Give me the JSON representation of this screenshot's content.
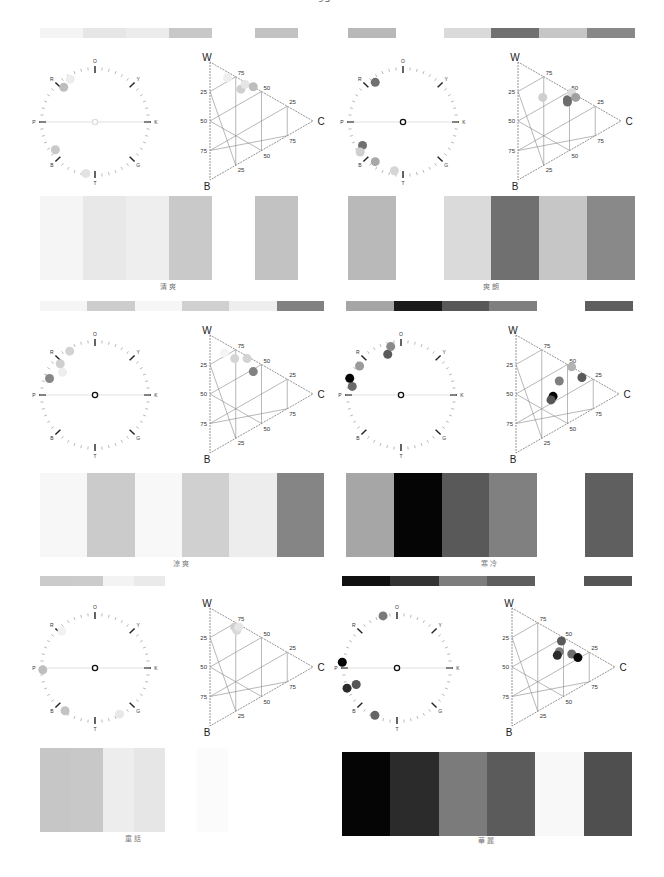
{
  "page_number": "95",
  "chart_data": [
    {
      "type": "palette_panel",
      "title": "清爽",
      "strip_colors": [
        "#f4f4f4",
        "#e6e6e6",
        "#ececec",
        "#c8c8c8",
        "",
        "#c2c2c2"
      ],
      "swatch_colors": [
        "#f5f5f5",
        "#e8e8e8",
        "#eeeeee",
        "#c9c9c9",
        "",
        "#c2c2c2"
      ],
      "hue_wheel": {
        "labels": [
          "O",
          "Y",
          "K",
          "G",
          "T",
          "B",
          "P",
          "R"
        ],
        "points": [
          {
            "angle": 100,
            "r": 0.95,
            "color": "#e3e3e3"
          },
          {
            "angle": 145,
            "r": 0.88,
            "color": "#c9c9c9"
          },
          {
            "angle": 228,
            "r": 0.85,
            "color": "#bdbdbd"
          },
          {
            "angle": 240,
            "r": 0.9,
            "color": "#ededed"
          }
        ],
        "center_color": "#ffffff"
      },
      "triangle": {
        "vertices": [
          "W",
          "B",
          "C"
        ],
        "ticks": [
          "25",
          "50",
          "75"
        ],
        "points": [
          {
            "w": 78,
            "b": 5,
            "c": 17,
            "color": "#eeeeee"
          },
          {
            "w": 62,
            "b": 8,
            "c": 30,
            "color": "#cfcfcf"
          },
          {
            "w": 64,
            "b": 2,
            "c": 34,
            "color": "#e5e5e5"
          },
          {
            "w": 58,
            "b": 0,
            "c": 42,
            "color": "#bdbdbd"
          }
        ]
      }
    },
    {
      "type": "palette_panel",
      "title": "爽朗",
      "strip_colors": [
        "#b8b8b8",
        "",
        "#dadada",
        "#707070",
        "#c6c6c6",
        "#888888"
      ],
      "swatch_colors": [
        "#b9b9b9",
        "",
        "#dadada",
        "#707070",
        "#c6c6c6",
        "#898989"
      ],
      "hue_wheel": {
        "labels": [
          "O",
          "Y",
          "K",
          "G",
          "T",
          "B",
          "P",
          "R"
        ],
        "points": [
          {
            "angle": 100,
            "r": 0.9,
            "color": "#d6d6d6"
          },
          {
            "angle": 125,
            "r": 0.88,
            "color": "#a8a8a8"
          },
          {
            "angle": 150,
            "r": 0.85,
            "color": "#707070"
          },
          {
            "angle": 145,
            "r": 0.95,
            "color": "#cfcfcf"
          },
          {
            "angle": 235,
            "r": 0.88,
            "color": "#707070"
          }
        ],
        "center_color": "#ffffff"
      },
      "triangle": {
        "vertices": [
          "W",
          "B",
          "C"
        ],
        "ticks": [
          "25",
          "50",
          "75"
        ],
        "points": [
          {
            "w": 58,
            "b": 18,
            "c": 24,
            "color": "#cfcfcf"
          },
          {
            "w": 42,
            "b": 10,
            "c": 48,
            "color": "#707070"
          },
          {
            "w": 44,
            "b": 8,
            "c": 48,
            "color": "#6c6c6c"
          },
          {
            "w": 48,
            "b": 0,
            "c": 52,
            "color": "#dadada"
          },
          {
            "w": 42,
            "b": 2,
            "c": 56,
            "color": "#a0a0a0"
          }
        ]
      }
    },
    {
      "type": "palette_panel",
      "title": "涼爽",
      "strip_colors": [
        "#f5f5f5",
        "#cdcdcd",
        "#f6f6f6",
        "#d0d0d0",
        "#eeeeee",
        "#818181"
      ],
      "swatch_colors": [
        "#f7f7f7",
        "#cbcbcb",
        "#f8f8f8",
        "#d0d0d0",
        "#ededed",
        "#858585"
      ],
      "hue_wheel": {
        "labels": [
          "O",
          "Y",
          "K",
          "G",
          "T",
          "B",
          "P",
          "R"
        ],
        "points": [
          {
            "angle": 200,
            "r": 0.88,
            "color": "#878787"
          },
          {
            "angle": 215,
            "r": 0.72,
            "color": "#eeeeee"
          },
          {
            "angle": 222,
            "r": 0.85,
            "color": "#cfcfcf"
          },
          {
            "angle": 240,
            "r": 0.92,
            "color": "#d3d3d3"
          }
        ],
        "center_color": "#ffffff"
      },
      "triangle": {
        "vertices": [
          "W",
          "B",
          "C"
        ],
        "ticks": [
          "25",
          "50",
          "75"
        ],
        "points": [
          {
            "w": 78,
            "b": 8,
            "c": 14,
            "color": "#f4f4f4"
          },
          {
            "w": 68,
            "b": 8,
            "c": 24,
            "color": "#d5d5d5"
          },
          {
            "w": 62,
            "b": 2,
            "c": 36,
            "color": "#d3d3d3"
          },
          {
            "w": 48,
            "b": 10,
            "c": 42,
            "color": "#818181"
          }
        ]
      }
    },
    {
      "type": "palette_panel",
      "title": "寒冷",
      "strip_colors": [
        "#a5a5a5",
        "#1a1a1a",
        "#585858",
        "#7f7f7f",
        "",
        "#5f5f5f"
      ],
      "swatch_colors": [
        "#a6a6a6",
        "#050505",
        "#595959",
        "#808080",
        "",
        "#5f5f5f"
      ],
      "hue_wheel": {
        "labels": [
          "O",
          "Y",
          "K",
          "G",
          "T",
          "B",
          "P",
          "R"
        ],
        "points": [
          {
            "angle": 190,
            "r": 0.9,
            "color": "#6a6a6a"
          },
          {
            "angle": 198,
            "r": 0.98,
            "color": "#050505"
          },
          {
            "angle": 215,
            "r": 0.92,
            "color": "#9a9a9a"
          },
          {
            "angle": 252,
            "r": 0.78,
            "color": "#5a5a5a"
          },
          {
            "angle": 258,
            "r": 0.9,
            "color": "#8a8a8a"
          }
        ],
        "center_color": "#ffffff"
      },
      "triangle": {
        "vertices": [
          "W",
          "B",
          "C"
        ],
        "ticks": [
          "25",
          "50",
          "75"
        ],
        "points": [
          {
            "w": 46,
            "b": 0,
            "c": 54,
            "color": "#b3b3b3"
          },
          {
            "w": 40,
            "b": 18,
            "c": 42,
            "color": "#7f7f7f"
          },
          {
            "w": 32,
            "b": 4,
            "c": 64,
            "color": "#5a5a5a"
          },
          {
            "w": 30,
            "b": 34,
            "c": 36,
            "color": "#050505"
          },
          {
            "w": 28,
            "b": 38,
            "c": 34,
            "color": "#555555"
          }
        ]
      }
    },
    {
      "type": "palette_panel",
      "title": "童話",
      "strip_colors": [
        "#cbcbcb",
        "#cccccc",
        "#f3f3f3",
        "#eaeaea",
        "",
        ""
      ],
      "swatch_colors": [
        "#c6c6c6",
        "#c8c8c8",
        "#ededed",
        "#e6e6e6",
        "",
        "#fbfbfb"
      ],
      "hue_wheel": {
        "labels": [
          "O",
          "Y",
          "K",
          "G",
          "T",
          "B",
          "P",
          "R"
        ],
        "points": [
          {
            "angle": 62,
            "r": 0.95,
            "color": "#e8e8e8"
          },
          {
            "angle": 125,
            "r": 0.95,
            "color": "#c3c3c3"
          },
          {
            "angle": 178,
            "r": 0.95,
            "color": "#bebebe"
          },
          {
            "angle": 228,
            "r": 0.9,
            "color": "#f2f2f2"
          }
        ],
        "center_color": "#ffffff"
      },
      "triangle": {
        "vertices": [
          "W",
          "B",
          "C"
        ],
        "ticks": [
          "25",
          "50",
          "75"
        ],
        "points": [
          {
            "w": 72,
            "b": 4,
            "c": 24,
            "color": "#cfcfcf"
          },
          {
            "w": 68,
            "b": 6,
            "c": 26,
            "color": "#d9d9d9"
          },
          {
            "w": 70,
            "b": 2,
            "c": 28,
            "color": "#e6e6e6"
          }
        ]
      }
    },
    {
      "type": "palette_panel",
      "title": "華麗",
      "strip_colors": [
        "#101010",
        "#333333",
        "#7d7d7d",
        "#5e5e5e",
        "",
        "#555555"
      ],
      "swatch_colors": [
        "#050505",
        "#2b2b2b",
        "#7b7b7b",
        "#5b5b5b",
        "#f8f8f8",
        "#4f4f4f"
      ],
      "hue_wheel": {
        "labels": [
          "O",
          "Y",
          "K",
          "G",
          "T",
          "B",
          "P",
          "R"
        ],
        "points": [
          {
            "angle": 115,
            "r": 0.95,
            "color": "#666666"
          },
          {
            "angle": 158,
            "r": 0.98,
            "color": "#2a2a2a"
          },
          {
            "angle": 158,
            "r": 0.8,
            "color": "#555555"
          },
          {
            "angle": 186,
            "r": 1.0,
            "color": "#050505"
          },
          {
            "angle": 255,
            "r": 0.98,
            "color": "#7a7a7a"
          }
        ],
        "center_color": "#ffffff"
      },
      "triangle": {
        "vertices": [
          "W",
          "B",
          "C"
        ],
        "ticks": [
          "25",
          "50",
          "75"
        ],
        "points": [
          {
            "w": 48,
            "b": 4,
            "c": 48,
            "color": "#5a5a5a"
          },
          {
            "w": 40,
            "b": 14,
            "c": 46,
            "color": "#7c7c7c"
          },
          {
            "w": 38,
            "b": 18,
            "c": 44,
            "color": "#2c2c2c"
          },
          {
            "w": 32,
            "b": 10,
            "c": 58,
            "color": "#6d6d6d"
          },
          {
            "w": 26,
            "b": 10,
            "c": 64,
            "color": "#0a0a0a"
          }
        ]
      }
    }
  ],
  "layout": {
    "panels": [
      {
        "x": 40,
        "stripY": 28,
        "wheelY": 52,
        "swY": 196,
        "capY": 281,
        "stripW": 258
      },
      {
        "x": 348,
        "stripY": 28,
        "wheelY": 52,
        "swY": 196,
        "capY": 281,
        "stripW": 287
      },
      {
        "x": 40,
        "stripY": 301,
        "wheelY": 325,
        "swY": 473,
        "capY": 558,
        "stripW": 284
      },
      {
        "x": 346,
        "stripY": 301,
        "wheelY": 325,
        "swY": 473,
        "capY": 558,
        "stripW": 287
      },
      {
        "x": 40,
        "stripY": 576,
        "wheelY": 598,
        "swY": 748,
        "capY": 833,
        "stripW": 188
      },
      {
        "x": 342,
        "stripY": 576,
        "wheelY": 598,
        "swY": 752,
        "capY": 835,
        "stripW": 290
      }
    ]
  }
}
